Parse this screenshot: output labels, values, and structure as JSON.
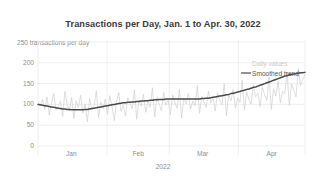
{
  "chart_data": {
    "type": "line",
    "title": "Transactions per Day, Jan. 1 to Apr. 30, 2022",
    "xlabel": "2022",
    "ylabel": "250 transactions per day",
    "ylabel_units": "transactions per day",
    "ylim": [
      0,
      250
    ],
    "xlim": [
      0,
      120
    ],
    "grid": true,
    "legend_position": "right-inside",
    "y_ticks": [
      0,
      50,
      100,
      150,
      200,
      250
    ],
    "y_tick_labels": [
      "0",
      "50",
      "100",
      "150",
      "200",
      "250"
    ],
    "x_tick_labels": [
      "Jan",
      "Feb",
      "Mar",
      "Apr"
    ],
    "x_tick_positions": [
      15,
      45,
      74,
      105
    ],
    "x_gridline_positions": [
      0,
      31,
      59,
      90,
      120
    ],
    "colors": {
      "daily": "#d0d0d0",
      "trend": "#4a4a4a",
      "grid": "#ebebeb",
      "title": "#3c3c3c",
      "tick": "#8e8e8e"
    },
    "series": [
      {
        "name": "Daily values",
        "type": "line",
        "color": "#d0d0d0",
        "values": [
          104,
          96,
          112,
          88,
          118,
          74,
          103,
          126,
          86,
          95,
          108,
          71,
          131,
          99,
          84,
          117,
          66,
          109,
          92,
          122,
          79,
          101,
          58,
          114,
          87,
          97,
          133,
          68,
          105,
          90,
          113,
          76,
          121,
          94,
          61,
          107,
          128,
          83,
          99,
          72,
          116,
          102,
          89,
          135,
          64,
          110,
          96,
          124,
          81,
          106,
          93,
          140,
          70,
          118,
          100,
          85,
          129,
          98,
          111,
          75,
          123,
          104,
          91,
          137,
          67,
          115,
          101,
          126,
          88,
          108,
          97,
          145,
          78,
          120,
          106,
          93,
          132,
          103,
          117,
          84,
          128,
          110,
          99,
          150,
          73,
          124,
          108,
          136,
          91,
          115,
          105,
          158,
          86,
          130,
          112,
          101,
          147,
          118,
          127,
          95,
          141,
          123,
          109,
          166,
          88,
          138,
          120,
          155,
          104,
          132,
          126,
          178,
          97,
          149,
          134,
          118,
          186,
          145,
          160,
          172
        ]
      },
      {
        "name": "Smoothed trend",
        "type": "line",
        "color": "#4a4a4a",
        "values": [
          100,
          99,
          98,
          97,
          96,
          95,
          94,
          93,
          92,
          91,
          90,
          89,
          89,
          88,
          88,
          87,
          87,
          87,
          87,
          87,
          87,
          88,
          88,
          89,
          90,
          91,
          92,
          93,
          94,
          95,
          96,
          97,
          98,
          99,
          100,
          101,
          102,
          103,
          104,
          104,
          105,
          105,
          106,
          106,
          107,
          107,
          108,
          108,
          109,
          109,
          110,
          110,
          111,
          111,
          112,
          112,
          112,
          113,
          113,
          113,
          113,
          113,
          113,
          113,
          113,
          113,
          113,
          113,
          113,
          113,
          113,
          113,
          113,
          114,
          114,
          115,
          115,
          116,
          117,
          118,
          119,
          120,
          121,
          122,
          123,
          124,
          126,
          127,
          128,
          130,
          131,
          133,
          134,
          136,
          137,
          139,
          141,
          142,
          144,
          146,
          148,
          150,
          152,
          154,
          156,
          158,
          160,
          162,
          164,
          166,
          168,
          169,
          171,
          172,
          173,
          174,
          175,
          176,
          176,
          177
        ]
      }
    ]
  },
  "legend": {
    "daily_label": "Daily values",
    "trend_label": "Smoothed trend"
  }
}
